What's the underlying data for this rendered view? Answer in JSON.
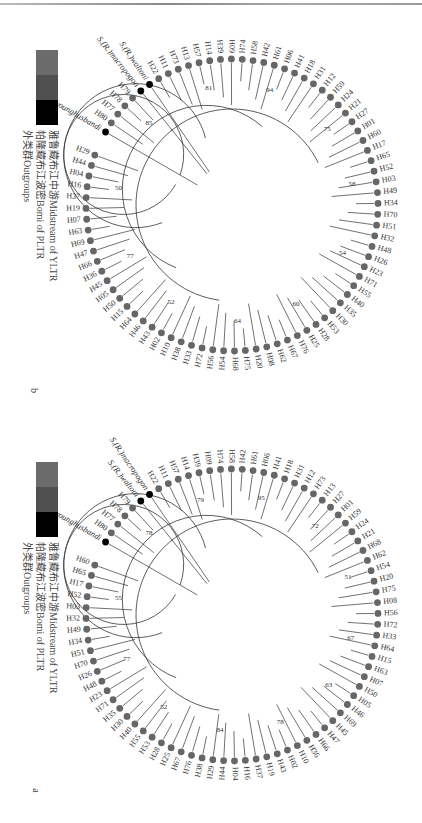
{
  "figure": {
    "rotation": "90deg",
    "colors": {
      "ylt_midstream": "#6b6b6b",
      "pltr_bomi": "#555555",
      "outgroups": "#000000",
      "tip_gray": "#666666",
      "line": "#333333"
    }
  },
  "legend": {
    "items": [
      {
        "label": "雅鲁藏布江中游Midstream of YLTR",
        "color": "#6b6b6b"
      },
      {
        "label": "帕隆藏布江波密Bomi of PLTR",
        "color": "#555555"
      },
      {
        "label": "外类群Outgroups",
        "color": "#000000"
      }
    ]
  },
  "panels": [
    {
      "id": "b",
      "letter": "b",
      "center": [
        232,
        205
      ],
      "tips": [
        "H29",
        "H44",
        "H04",
        "H16",
        "H37",
        "H19",
        "H07",
        "H63",
        "H69",
        "H47",
        "H66",
        "H36",
        "H45",
        "H05",
        "H50",
        "H15",
        "H64",
        "H46",
        "H43",
        "H02",
        "H10",
        "H38",
        "H33",
        "H72",
        "H56",
        "H54",
        "H68",
        "H75",
        "H20",
        "H08",
        "H62",
        "H67",
        "H76",
        "H25",
        "H28",
        "H53",
        "H30",
        "H35",
        "H40",
        "H55",
        "H71",
        "H23",
        "H26",
        "H48",
        "H32",
        "H51",
        "H70",
        "H34",
        "H49",
        "H03",
        "H52",
        "H65",
        "H17",
        "H60",
        "H01",
        "H27",
        "H21",
        "H24",
        "H59",
        "H12",
        "H31",
        "H18",
        "H41",
        "H06",
        "H61",
        "H42",
        "H58",
        "H74",
        "H09",
        "H39",
        "H14",
        "H57",
        "H13",
        "H73",
        "H11",
        "H22",
        "S.(R.)waltoni",
        "S.(R.)macropogon",
        "H79",
        "H78",
        "H77",
        "H80",
        "S.younghusbandi"
      ],
      "outgroups": [
        "S.(R.)waltoni",
        "S.(R.)macropogon",
        "S.younghusbandi"
      ],
      "bootstrap": [
        "50",
        "77",
        "52",
        "64",
        "60",
        "54",
        "58",
        "75",
        "94",
        "81",
        "85"
      ]
    },
    {
      "id": "a",
      "letter": "a",
      "center": [
        232,
        205
      ],
      "tips": [
        "H60",
        "H65",
        "H17",
        "H52",
        "H03",
        "H32",
        "H49",
        "H34",
        "H51",
        "H70",
        "H26",
        "H48",
        "H23",
        "H71",
        "H35",
        "H30",
        "H40",
        "H55",
        "H53",
        "H28",
        "H25",
        "H67",
        "H76",
        "H38",
        "H29",
        "H44",
        "H04",
        "H16",
        "H37",
        "H19",
        "H43",
        "H02",
        "H10",
        "H36",
        "H66",
        "H47",
        "H45",
        "H69",
        "H46",
        "H05",
        "H50",
        "H07",
        "H63",
        "H15",
        "H64",
        "H33",
        "H72",
        "H56",
        "H08",
        "H75",
        "H20",
        "H54",
        "H62",
        "H68",
        "H21",
        "H24",
        "H59",
        "H01",
        "H27",
        "H13",
        "H73",
        "H12",
        "H31",
        "H18",
        "H41",
        "H06",
        "H61",
        "H42",
        "H58",
        "H74",
        "H09",
        "H39",
        "H14",
        "H57",
        "H11",
        "H22",
        "S.(R.)macropogon",
        "S.(R.)waltoni",
        "H79",
        "H78",
        "H77",
        "H80",
        "S. younghusbandi"
      ],
      "outgroups": [
        "S.(R.)macropogon",
        "S.(R.)waltoni",
        "S. younghusbandi"
      ],
      "bootstrap": [
        "55",
        "77",
        "52",
        "84",
        "78",
        "63",
        "67",
        "51",
        "72",
        "95",
        "79",
        "78"
      ]
    }
  ]
}
